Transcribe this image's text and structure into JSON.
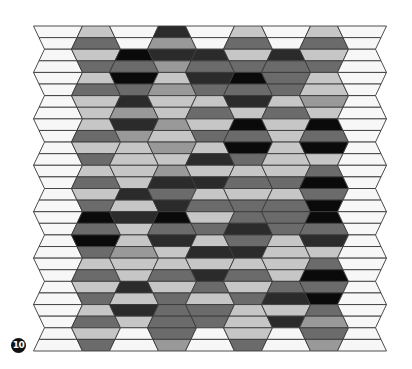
{
  "figure": {
    "badge_label": "10",
    "palette": {
      "W": "#f7f7f7",
      "L": "#c6c6c6",
      "M": "#999999",
      "D": "#6b6b6b",
      "K": "#2b2b2b",
      "B": "#0a0a0a"
    },
    "outline_color": "#3a3a3a",
    "grid": {
      "columns": 9,
      "stripes": 28,
      "top_y": 26,
      "bottom_y": 351,
      "first_column_center_x": 58,
      "column_pitch": 38,
      "hex_half_width_wide": 24.5,
      "hex_half_width_narrow": 13.5
    },
    "columns": [
      {
        "name": "column-1",
        "stripes": "WWWWWWWWWWWWWWWWWWWWWWWWWWWW"
      },
      {
        "name": "column-2",
        "stripes": "LDLDLDLLLDLDLDLDBDBDLDLDLDLD"
      },
      {
        "name": "column-3",
        "stripes": "WWBDBDKMKMLLLLKLKLLMLLKLKLWW"
      },
      {
        "name": "column-4",
        "stripes": "KMKMLMLLMLMLMKDKBDKLLDLDDDDM"
      },
      {
        "name": "column-5",
        "stripes": "WWKDKDLDLDLKLKLDLDLKLKDLDDWW"
      },
      {
        "name": "column-6",
        "stripes": "LDLDBDKLBDBDLDLDDKDKLDLDLLLD"
      },
      {
        "name": "column-7",
        "stripes": "WWKDDDLDLLLLLDLDDDLLLLDKLKWW"
      },
      {
        "name": "column-8",
        "stripes": "LDLDLLMLBDBLDBDBBDKLDBDBDMDM"
      },
      {
        "name": "column-9",
        "stripes": "WWWWWWWWWWWWWWWWWWWWWWWWWWWW"
      }
    ]
  }
}
